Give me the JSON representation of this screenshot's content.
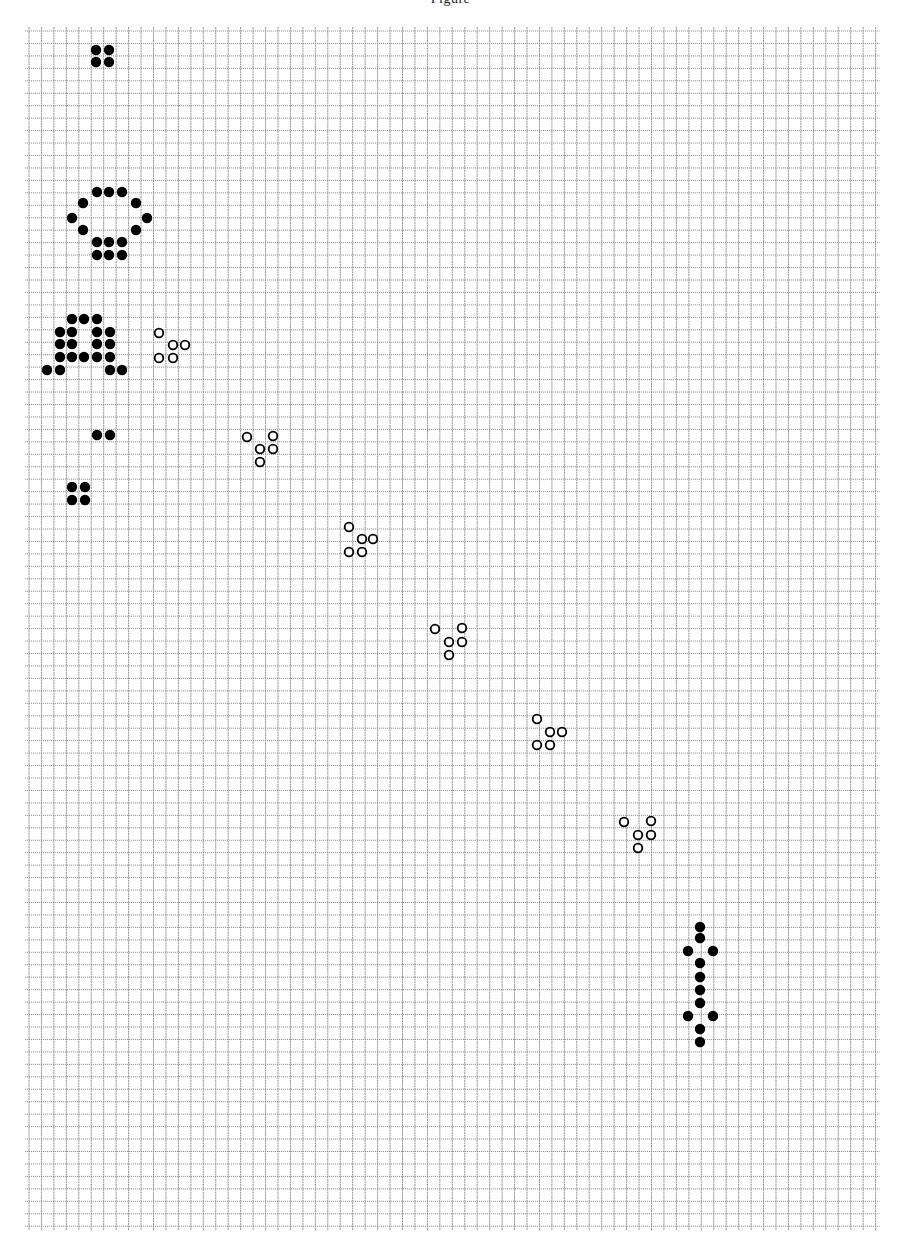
{
  "caption": "Figure",
  "grid": {
    "x0": 29,
    "y0": 31,
    "step": 12.45,
    "cols": 68,
    "rows": 96,
    "line_color": "#8a8a8a",
    "line_width": 0.9,
    "overhang": 4
  },
  "cell_style": {
    "radius": 5.2,
    "live_fill": "#000000",
    "ghost_stroke": "#000000",
    "ghost_stroke_width": 1.8,
    "ghost_radius": 4.3
  },
  "patterns": [
    {
      "name": "block-top",
      "kind": "live",
      "cells": [
        [
          96,
          50
        ],
        [
          109,
          50
        ],
        [
          96,
          62
        ],
        [
          109,
          62
        ]
      ]
    },
    {
      "name": "gun-ring",
      "kind": "live",
      "cells": [
        [
          97,
          192
        ],
        [
          109,
          192
        ],
        [
          122,
          192
        ],
        [
          83,
          203
        ],
        [
          136,
          203
        ],
        [
          72,
          218
        ],
        [
          147,
          218
        ],
        [
          83,
          230
        ],
        [
          136,
          230
        ],
        [
          97,
          242
        ],
        [
          109,
          242
        ],
        [
          122,
          242
        ],
        [
          97,
          255
        ],
        [
          109,
          255
        ],
        [
          122,
          255
        ]
      ]
    },
    {
      "name": "gun-body",
      "kind": "live",
      "cells": [
        [
          72,
          319
        ],
        [
          84,
          319
        ],
        [
          97,
          319
        ],
        [
          60,
          332
        ],
        [
          72,
          332
        ],
        [
          97,
          332
        ],
        [
          110,
          332
        ],
        [
          60,
          344
        ],
        [
          72,
          344
        ],
        [
          97,
          344
        ],
        [
          110,
          344
        ],
        [
          60,
          357
        ],
        [
          72,
          357
        ],
        [
          84,
          357
        ],
        [
          97,
          357
        ],
        [
          110,
          357
        ],
        [
          47,
          370
        ],
        [
          60,
          370
        ],
        [
          110,
          370
        ],
        [
          122,
          370
        ]
      ]
    },
    {
      "name": "pair",
      "kind": "live",
      "cells": [
        [
          97,
          435
        ],
        [
          110,
          435
        ]
      ]
    },
    {
      "name": "block-bottom",
      "kind": "live",
      "cells": [
        [
          72,
          487
        ],
        [
          85,
          487
        ],
        [
          72,
          500
        ],
        [
          85,
          500
        ]
      ]
    },
    {
      "name": "glider-1",
      "kind": "ghost",
      "cells": [
        [
          159,
          333
        ],
        [
          173,
          345
        ],
        [
          185,
          345
        ],
        [
          159,
          358
        ],
        [
          173,
          358
        ]
      ]
    },
    {
      "name": "glider-2",
      "kind": "ghost",
      "cells": [
        [
          247,
          437
        ],
        [
          273,
          436
        ],
        [
          260,
          449
        ],
        [
          273,
          449
        ],
        [
          260,
          462
        ]
      ]
    },
    {
      "name": "glider-3",
      "kind": "ghost",
      "cells": [
        [
          349,
          527
        ],
        [
          362,
          539
        ],
        [
          373,
          539
        ],
        [
          349,
          552
        ],
        [
          362,
          552
        ]
      ]
    },
    {
      "name": "glider-4",
      "kind": "ghost",
      "cells": [
        [
          435,
          629
        ],
        [
          462,
          628
        ],
        [
          449,
          642
        ],
        [
          462,
          642
        ],
        [
          449,
          655
        ]
      ]
    },
    {
      "name": "glider-5",
      "kind": "ghost",
      "cells": [
        [
          537,
          719
        ],
        [
          550,
          732
        ],
        [
          562,
          732
        ],
        [
          537,
          745
        ],
        [
          550,
          745
        ]
      ]
    },
    {
      "name": "glider-6",
      "kind": "ghost",
      "cells": [
        [
          624,
          822
        ],
        [
          651,
          821
        ],
        [
          638,
          835
        ],
        [
          651,
          835
        ],
        [
          638,
          848
        ]
      ]
    },
    {
      "name": "eater-column",
      "kind": "live",
      "cells": [
        [
          700,
          927
        ],
        [
          700,
          938
        ],
        [
          688,
          951
        ],
        [
          713,
          951
        ],
        [
          700,
          963
        ],
        [
          700,
          977
        ],
        [
          700,
          990
        ],
        [
          700,
          1003
        ],
        [
          688,
          1016
        ],
        [
          713,
          1016
        ],
        [
          700,
          1029
        ],
        [
          700,
          1042
        ]
      ]
    }
  ]
}
